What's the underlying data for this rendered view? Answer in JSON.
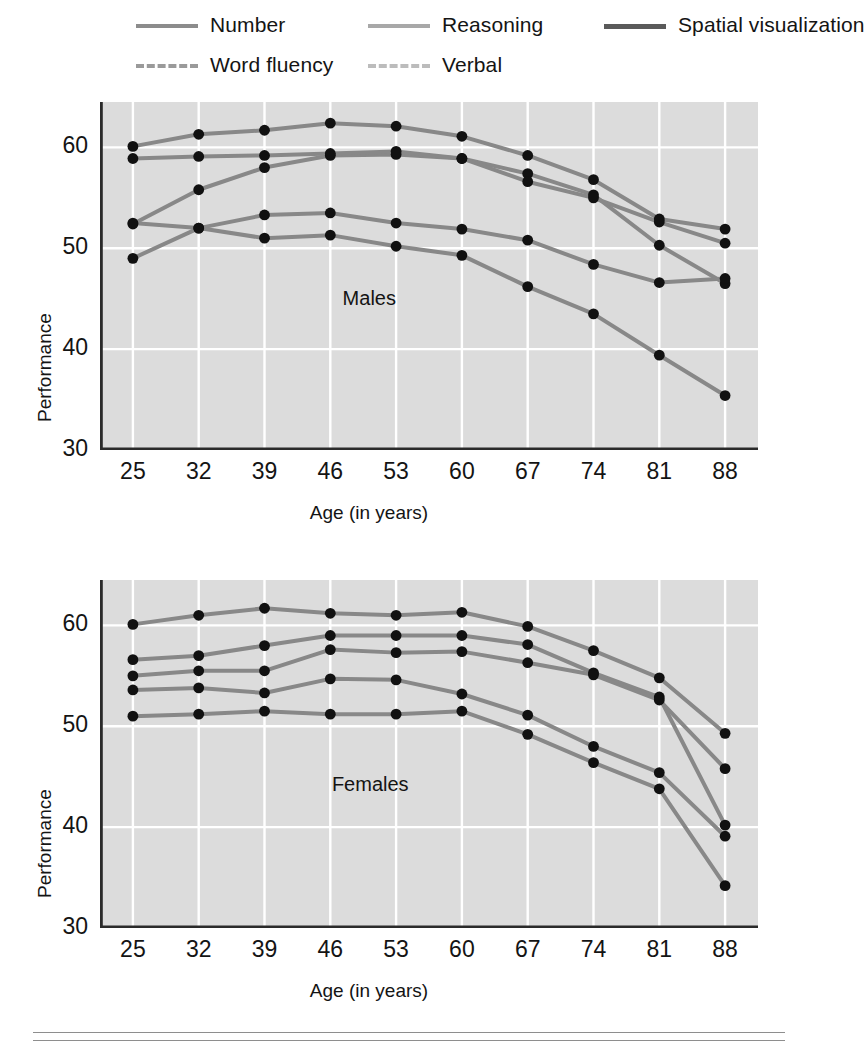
{
  "figure": {
    "ylabel": "Performance",
    "xlabel": "Age (in years)",
    "y_ticks": [
      "30",
      "40",
      "50",
      "60"
    ],
    "x_ticks": [
      "25",
      "32",
      "39",
      "46",
      "53",
      "60",
      "67",
      "74",
      "81",
      "88"
    ],
    "panel_notes": {
      "top": "Males",
      "bottom": "Females"
    }
  },
  "legend": {
    "items": [
      {
        "label": "Number",
        "color": "#8c8c8c",
        "dash": false,
        "width": 4.0
      },
      {
        "label": "Reasoning",
        "color": "#a8a8a8",
        "dash": false,
        "width": 4.0
      },
      {
        "label": "Spatial visualization",
        "color": "#5a5a5a",
        "dash": false,
        "width": 5.0
      },
      {
        "label": "Word fluency",
        "color": "#9a9a9a",
        "dash": true,
        "width": 4.5
      },
      {
        "label": "Verbal",
        "color": "#bcbcbc",
        "dash": true,
        "width": 4.5
      }
    ]
  },
  "colors": {
    "plot_background": "#dcdcdc",
    "gridline": "#ffffff",
    "axis": "#2b2b2b",
    "marker": "#111111",
    "rule": "#8e8e8e"
  },
  "chart_data": [
    {
      "type": "line",
      "title": "Males",
      "xlabel": "Age (in years)",
      "ylabel": "Performance",
      "x": [
        25,
        32,
        39,
        46,
        53,
        60,
        67,
        74,
        81,
        88
      ],
      "xlim": [
        21.5,
        91.5
      ],
      "ylim": [
        30,
        64.5
      ],
      "yticks": [
        30,
        40,
        50,
        60
      ],
      "grid": true,
      "legend_position": "above-figure",
      "series": [
        {
          "name": "Number",
          "values": [
            49.0,
            52.0,
            51.0,
            51.3,
            50.2,
            49.3,
            46.2,
            43.5,
            39.4,
            35.4
          ]
        },
        {
          "name": "Reasoning",
          "values": [
            58.9,
            59.1,
            59.2,
            59.4,
            59.6,
            58.9,
            56.6,
            55.0,
            52.6,
            50.5
          ]
        },
        {
          "name": "Spatial visualization",
          "values": [
            60.1,
            61.3,
            61.7,
            62.4,
            62.1,
            61.1,
            59.2,
            56.8,
            52.9,
            51.9
          ]
        },
        {
          "name": "Word fluency",
          "values": [
            52.5,
            52.0,
            53.3,
            53.5,
            52.5,
            51.9,
            50.8,
            48.4,
            46.6,
            47.0
          ]
        },
        {
          "name": "Verbal",
          "values": [
            52.4,
            55.8,
            58.0,
            59.2,
            59.3,
            58.9,
            57.4,
            55.3,
            50.3,
            46.5
          ]
        }
      ]
    },
    {
      "type": "line",
      "title": "Females",
      "xlabel": "Age (in years)",
      "ylabel": "Performance",
      "x": [
        25,
        32,
        39,
        46,
        53,
        60,
        67,
        74,
        81,
        88
      ],
      "xlim": [
        21.5,
        91.5
      ],
      "ylim": [
        30,
        64.5
      ],
      "yticks": [
        30,
        40,
        50,
        60
      ],
      "grid": true,
      "legend_position": "above-figure",
      "series": [
        {
          "name": "Number",
          "values": [
            51.0,
            51.2,
            51.5,
            51.2,
            51.2,
            51.5,
            49.2,
            46.4,
            43.8,
            34.2
          ]
        },
        {
          "name": "Reasoning",
          "values": [
            60.1,
            61.0,
            61.7,
            61.2,
            61.0,
            61.3,
            59.9,
            57.5,
            54.8,
            49.3
          ]
        },
        {
          "name": "Spatial visualization",
          "values": [
            55.0,
            55.5,
            55.5,
            57.6,
            57.3,
            57.4,
            56.3,
            55.1,
            52.6,
            45.8
          ]
        },
        {
          "name": "Word fluency",
          "values": [
            53.6,
            53.8,
            53.3,
            54.7,
            54.6,
            53.2,
            51.1,
            48.0,
            45.4,
            39.1
          ]
        },
        {
          "name": "Verbal",
          "values": [
            56.6,
            57.0,
            58.0,
            59.0,
            59.0,
            59.0,
            58.1,
            55.3,
            52.9,
            40.2
          ]
        }
      ]
    }
  ]
}
